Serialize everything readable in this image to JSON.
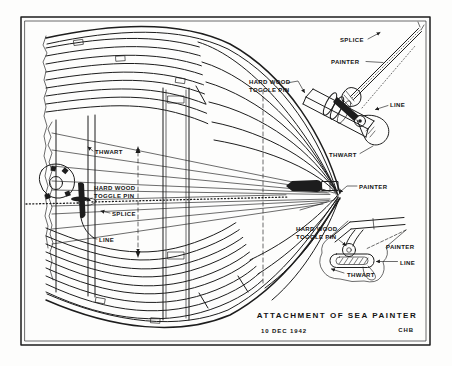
{
  "drawing": {
    "title": "ATTACHMENT OF SEA PAINTER",
    "date": "10 DEC 1942",
    "initials": "CHB",
    "ink_color": "#1d1d1d",
    "paper_color": "#fdfdfc"
  },
  "main_view": {
    "labels": {
      "thwart": "THWART",
      "hard_wood_1": "HARD WOOD",
      "hard_wood_2": "TOGGLE PIN",
      "splice": "SPLICE",
      "line": "LINE",
      "painter": "PAINTER"
    }
  },
  "perspective_inset": {
    "labels": {
      "splice": "SPLICE",
      "painter": "PAINTER",
      "hard_wood_1": "HARD WOOD",
      "hard_wood_2": "TOGGLE PIN",
      "line": "LINE",
      "thwart": "THWART"
    }
  },
  "section_inset": {
    "labels": {
      "hard_wood_1": "HARD WOOD",
      "hard_wood_2": "TOGGLE PIN",
      "painter": "PAINTER",
      "line": "LINE",
      "thwart": "THWART"
    }
  }
}
